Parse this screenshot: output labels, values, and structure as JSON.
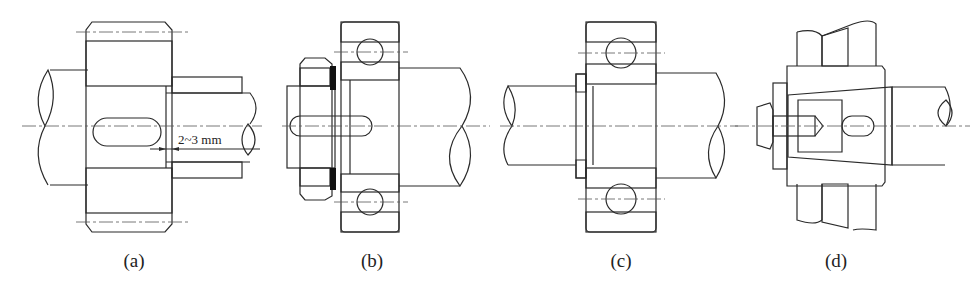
{
  "figure": {
    "panels": [
      {
        "id": "a",
        "caption": "(a)",
        "description": "Gear hub keyed on shaft, spacer sleeve leaving axial gap",
        "dimension_label": "2~3 mm"
      },
      {
        "id": "b",
        "caption": "(b)",
        "description": "Bearing on shaft end secured by round nut and tab washer"
      },
      {
        "id": "c",
        "caption": "(c)",
        "description": "Bearing retained on shaft by circlip (snap ring)"
      },
      {
        "id": "d",
        "caption": "(d)",
        "description": "Hub on tapered shaft end secured by end bolt and plate"
      }
    ]
  },
  "colors": {
    "line": "#2a2a2a",
    "background": "#ffffff"
  }
}
